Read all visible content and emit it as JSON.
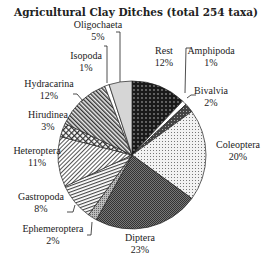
{
  "chart_data": {
    "type": "pie",
    "title": "Agricultural Clay Ditches (total 254 taxa)",
    "start_angle_deg": 0,
    "direction": "clockwise",
    "slices": [
      {
        "label": "Rest",
        "value": 12,
        "pct_label": "12%",
        "pattern": "dots-dark"
      },
      {
        "label": "Amphipoda",
        "value": 1,
        "pct_label": "1%",
        "pattern": "white"
      },
      {
        "label": "Bivalvia",
        "value": 2,
        "pct_label": "2%",
        "pattern": "dark-grid"
      },
      {
        "label": "Coleoptera",
        "value": 20,
        "pct_label": "20%",
        "pattern": "light-dots"
      },
      {
        "label": "Diptera",
        "value": 23,
        "pct_label": "23%",
        "pattern": "dark-checker"
      },
      {
        "label": "Ephemeroptera",
        "value": 2,
        "pct_label": "2%",
        "pattern": "grey-dots"
      },
      {
        "label": "Gastropoda",
        "value": 8,
        "pct_label": "8%",
        "pattern": "hatch-horizontal"
      },
      {
        "label": "Heteroptera",
        "value": 11,
        "pct_label": "11%",
        "pattern": "hatch-diag-light"
      },
      {
        "label": "Hirudinea",
        "value": 3,
        "pct_label": "3%",
        "pattern": "hatch-cross"
      },
      {
        "label": "Hydracarina",
        "value": 12,
        "pct_label": "12%",
        "pattern": "hatch-diag-dense"
      },
      {
        "label": "Isopoda",
        "value": 1,
        "pct_label": "1%",
        "pattern": "white"
      },
      {
        "label": "Oligochaeta",
        "value": 5,
        "pct_label": "5%",
        "pattern": "light-grey"
      }
    ],
    "total_taxa": 254
  }
}
